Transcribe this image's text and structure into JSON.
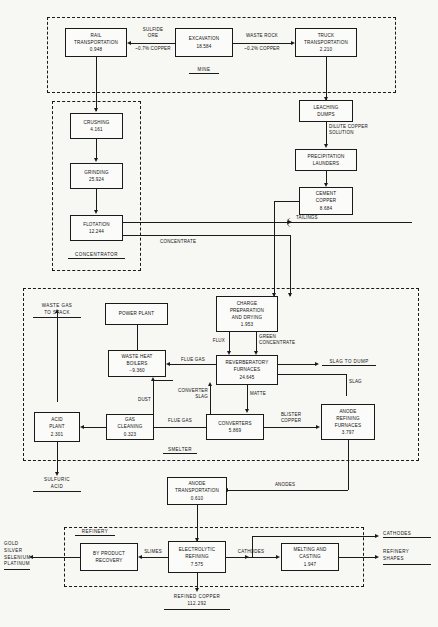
{
  "diagram": {
    "sections": [
      {
        "id": "mine",
        "label": "MINE"
      },
      {
        "id": "concentrator",
        "label": "CONCENTRATOR"
      },
      {
        "id": "smelter",
        "label": "SMELTER"
      },
      {
        "id": "refinery",
        "label": "REFINERY"
      }
    ],
    "nodes": {
      "rail_transportation": {
        "l1": "RAIL",
        "l2": "TRANSPORTATION",
        "value": "0.948"
      },
      "excavation": {
        "l1": "EXCAVATION",
        "value": "18.584"
      },
      "truck_transportation": {
        "l1": "TRUCK",
        "l2": "TRANSPORTATION",
        "value": "2.210"
      },
      "leaching_dumps": {
        "l1": "LEACHING",
        "l2": "DUMPS"
      },
      "precipitation_launders": {
        "l1": "PRECIPITATION",
        "l2": "LAUNDERS"
      },
      "cement_copper": {
        "l1": "CEMENT",
        "l2": "COPPER",
        "value": "8.684"
      },
      "crushing": {
        "l1": "CRUSHING",
        "value": "4.161"
      },
      "grinding": {
        "l1": "GRINDING",
        "value": "25.924"
      },
      "flotation": {
        "l1": "FLOTATION",
        "value": "12.244"
      },
      "power_plant": {
        "l1": "POWER PLANT"
      },
      "waste_heat_boilers": {
        "l1": "WASTE HEAT",
        "l2": "BOILERS",
        "value": "−9.360"
      },
      "charge_preparation": {
        "l1": "CHARGE",
        "l2": "PREPARATION",
        "l3": "AND DRYING",
        "value": "1.953"
      },
      "reverberatory_furnaces": {
        "l1": "REVERBERATORY",
        "l2": "FURNACES",
        "value": "24.645"
      },
      "converters": {
        "l1": "CONVERTERS",
        "value": "5.869"
      },
      "anode_refining_furnaces": {
        "l1": "ANODE",
        "l2": "REFINING",
        "l3": "FURNACES",
        "value": "3.797"
      },
      "gas_cleaning": {
        "l1": "GAS",
        "l2": "CLEANING",
        "value": "0.323"
      },
      "acid_plant": {
        "l1": "ACID",
        "l2": "PLANT",
        "value": "2.301"
      },
      "anode_transportation": {
        "l1": "ANODE",
        "l2": "TRANSPORTATION",
        "value": "0.610"
      },
      "by_product_recovery": {
        "l1": "BY PRODUCT",
        "l2": "RECOVERY"
      },
      "electrolytic_refining": {
        "l1": "ELECTROLYTIC",
        "l2": "REFINING",
        "value": "7.575"
      },
      "melting_and_casting": {
        "l1": "MELTING AND",
        "l2": "CASTING",
        "value": "1.947"
      }
    },
    "flow_labels": {
      "sulfide_ore": "SULFIDE",
      "sulfide_ore_2": "ORE",
      "sulfide_ore_grade": "~0.7% COPPER",
      "waste_rock": "WASTE ROCK",
      "waste_rock_grade": "~0.2% COPPER",
      "dilute_copper_solution_1": "DILUTE COPPER",
      "dilute_copper_solution_2": "SOLUTION",
      "tailings": "TAILINGS",
      "concentrate": "CONCENTRATE",
      "waste_gas_to_stack_1": "WASTE GAS",
      "waste_gas_to_stack_2": "TO STACK",
      "flue_gas_top": "FLUE GAS",
      "flue_gas_bottom": "FLUE GAS",
      "dust": "DUST",
      "converter_slag_1": "CONVERTER",
      "converter_slag_2": "SLAG",
      "flux": "FLUX",
      "green_concentrate_1": "GREEN",
      "green_concentrate_2": "CONCENTRATE",
      "slag_to_dump": "SLAG TO DUMP",
      "matte": "MATTE",
      "slag": "SLAG",
      "blister_copper_1": "BLISTER",
      "blister_copper_2": "COPPER",
      "sulfuric_acid_1": "SULFURIC",
      "sulfuric_acid_2": "ACID",
      "anodes": "ANODES",
      "slimes": "SLIMES",
      "cathodes_mid": "CATHODES",
      "cathodes_out": "CATHODES",
      "refinery_shapes_1": "REFINERY",
      "refinery_shapes_2": "SHAPES",
      "refined_copper": "REFINED COPPER",
      "refined_copper_value": "112.292",
      "byproducts_1": "GOLD",
      "byproducts_2": "SILVER",
      "byproducts_3": "SELENIUM",
      "byproducts_4": "PLATINUM"
    }
  }
}
